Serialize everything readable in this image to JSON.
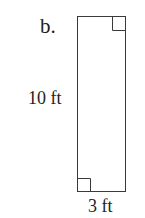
{
  "problem_label": "b.",
  "figure": {
    "shape": "rectangle",
    "height_label": "10 ft",
    "width_label": "3 ft",
    "right_angle_markers": [
      "top-right",
      "bottom-left"
    ],
    "colors": {
      "stroke": "#3a3a3a",
      "background": "#ffffff",
      "text": "#1e1e1e"
    }
  }
}
